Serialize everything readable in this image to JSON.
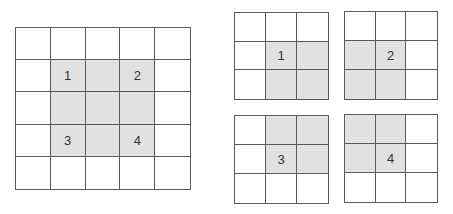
{
  "colors": {
    "line": "#5a5a5a",
    "shade": "#e1e1e1",
    "label": "#333333"
  },
  "grids": [
    {
      "name": "large-grid",
      "x": 15,
      "y": 27,
      "w": 176,
      "h": 163,
      "rows": 5,
      "cols": 5,
      "shaded": [
        [
          1,
          1
        ],
        [
          1,
          2
        ],
        [
          1,
          3
        ],
        [
          2,
          1
        ],
        [
          2,
          2
        ],
        [
          2,
          3
        ],
        [
          3,
          1
        ],
        [
          3,
          2
        ],
        [
          3,
          3
        ]
      ],
      "labels": [
        {
          "r": 1,
          "c": 1,
          "text": "1"
        },
        {
          "r": 1,
          "c": 3,
          "text": "2"
        },
        {
          "r": 3,
          "c": 1,
          "text": "3"
        },
        {
          "r": 3,
          "c": 3,
          "text": "4"
        }
      ]
    },
    {
      "name": "small-grid-1",
      "x": 234,
      "y": 12,
      "w": 95,
      "h": 88,
      "rows": 3,
      "cols": 3,
      "shaded": [
        [
          1,
          1
        ],
        [
          1,
          2
        ],
        [
          2,
          1
        ],
        [
          2,
          2
        ]
      ],
      "labels": [
        {
          "r": 1,
          "c": 1,
          "text": "1"
        }
      ]
    },
    {
      "name": "small-grid-2",
      "x": 344,
      "y": 11,
      "w": 94,
      "h": 89,
      "rows": 3,
      "cols": 3,
      "shaded": [
        [
          1,
          0
        ],
        [
          1,
          1
        ],
        [
          2,
          0
        ],
        [
          2,
          1
        ]
      ],
      "labels": [
        {
          "r": 1,
          "c": 1,
          "text": "2"
        }
      ]
    },
    {
      "name": "small-grid-3",
      "x": 234,
      "y": 115,
      "w": 95,
      "h": 89,
      "rows": 3,
      "cols": 3,
      "shaded": [
        [
          0,
          1
        ],
        [
          0,
          2
        ],
        [
          1,
          1
        ],
        [
          1,
          2
        ]
      ],
      "labels": [
        {
          "r": 1,
          "c": 1,
          "text": "3"
        }
      ]
    },
    {
      "name": "small-grid-4",
      "x": 344,
      "y": 114,
      "w": 94,
      "h": 89,
      "rows": 3,
      "cols": 3,
      "shaded": [
        [
          0,
          0
        ],
        [
          0,
          1
        ],
        [
          1,
          0
        ],
        [
          1,
          1
        ]
      ],
      "labels": [
        {
          "r": 1,
          "c": 1,
          "text": "4"
        }
      ]
    }
  ]
}
